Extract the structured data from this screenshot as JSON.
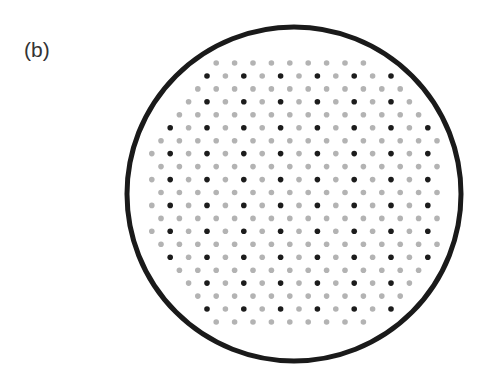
{
  "panel_label": "(b)",
  "figure": {
    "circle": {
      "cx": 294,
      "cy": 194,
      "r": 167,
      "stroke": "#1a1a1a",
      "stroke_width": 5
    },
    "lattice": {
      "rows": 21,
      "y0": 63,
      "dy": 12.95,
      "x_base": 207,
      "dx": 18.4,
      "clip_cx": 296,
      "clip_cy": 193,
      "clip_r": 153,
      "dot_radius": 2.8
    },
    "colors": {
      "light_dot": "#b3b3b3",
      "dark_dot": "#1c1c1c"
    }
  }
}
